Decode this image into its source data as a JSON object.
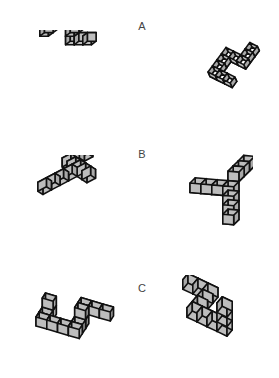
{
  "colors": {
    "top": "#ffffff",
    "left": "#bdbdbd",
    "right": "#a9a9a9",
    "edge": "#111111"
  },
  "pairs": [
    {
      "label": "A",
      "left_figure": {
        "name": "figure-a-left",
        "x": 20,
        "y": 30,
        "w": 105,
        "h": 62,
        "origin": [
          34,
          4
        ],
        "scale": 8.6,
        "proj": [
          [
            1,
            0.0
          ],
          [
            -0.55,
            0.42
          ],
          [
            0,
            -1
          ]
        ],
        "cubes": [
          [
            0,
            0,
            1
          ],
          [
            1,
            0,
            1
          ],
          [
            2,
            0,
            1
          ],
          [
            3,
            0,
            1
          ],
          [
            0,
            1,
            1
          ],
          [
            0,
            2,
            1
          ],
          [
            3,
            1,
            1
          ],
          [
            3,
            2,
            0
          ],
          [
            3,
            2,
            1
          ],
          [
            4,
            2,
            0
          ],
          [
            5,
            2,
            0
          ]
        ]
      },
      "right_figure": {
        "name": "figure-a-right",
        "x": 168,
        "y": 22,
        "w": 100,
        "h": 72,
        "origin": [
          40,
          50
        ],
        "scale": 8.2,
        "proj": [
          [
            0.9,
            0.45
          ],
          [
            0.55,
            -0.75
          ],
          [
            0.25,
            0.55
          ]
        ],
        "cubes": [
          [
            0,
            0,
            0
          ],
          [
            1,
            0,
            0
          ],
          [
            2,
            0,
            0
          ],
          [
            0,
            1,
            0
          ],
          [
            0,
            2,
            0
          ],
          [
            0,
            3,
            0
          ],
          [
            1,
            3,
            0
          ],
          [
            2,
            3,
            0
          ],
          [
            2,
            4,
            0
          ],
          [
            2,
            5,
            0
          ]
        ]
      }
    },
    {
      "label": "B",
      "left_figure": {
        "name": "figure-b-left",
        "x": 18,
        "y": 155,
        "w": 100,
        "h": 80,
        "origin": [
          10,
          30
        ],
        "scale": 9,
        "proj": [
          [
            0.95,
            -0.5
          ],
          [
            0.55,
            0.35
          ],
          [
            0,
            -1
          ]
        ],
        "cubes": [
          [
            0,
            2,
            0
          ],
          [
            1,
            2,
            0
          ],
          [
            2,
            2,
            0
          ],
          [
            3,
            2,
            0
          ],
          [
            4,
            0,
            0
          ],
          [
            4,
            1,
            0
          ],
          [
            4,
            2,
            0
          ],
          [
            4,
            3,
            0
          ],
          [
            4,
            4,
            0
          ],
          [
            5,
            0,
            0
          ],
          [
            6,
            0,
            0
          ]
        ]
      },
      "right_figure": {
        "name": "figure-b-right",
        "x": 178,
        "y": 143,
        "w": 75,
        "h": 100,
        "origin": [
          12,
          40
        ],
        "scale": 9.5,
        "proj": [
          [
            1.15,
            0.1
          ],
          [
            0.55,
            -0.55
          ],
          [
            0,
            1
          ]
        ],
        "cubes": [
          [
            0,
            0,
            0
          ],
          [
            1,
            0,
            0
          ],
          [
            2,
            0,
            0
          ],
          [
            3,
            0,
            0
          ],
          [
            3,
            0,
            1
          ],
          [
            3,
            0,
            2
          ],
          [
            3,
            0,
            3
          ],
          [
            3,
            1,
            -1
          ],
          [
            3,
            2,
            -1
          ],
          [
            3,
            3,
            -1
          ]
        ]
      }
    },
    {
      "label": "C",
      "left_figure": {
        "name": "figure-c-left",
        "x": 28,
        "y": 290,
        "w": 110,
        "h": 65,
        "origin": [
          8,
          36
        ],
        "scale": 9,
        "proj": [
          [
            1.2,
            0.35
          ],
          [
            0.35,
            -0.55
          ],
          [
            0,
            -1
          ]
        ],
        "cubes": [
          [
            0,
            0,
            0
          ],
          [
            1,
            0,
            0
          ],
          [
            2,
            0,
            0
          ],
          [
            3,
            0,
            0
          ],
          [
            0,
            1,
            0
          ],
          [
            0,
            2,
            0
          ],
          [
            0,
            2,
            1
          ],
          [
            3,
            1,
            0
          ],
          [
            3,
            2,
            0
          ],
          [
            3,
            2,
            1
          ],
          [
            3,
            3,
            1
          ],
          [
            4,
            3,
            1
          ],
          [
            5,
            3,
            1
          ]
        ]
      },
      "right_figure": {
        "name": "figure-c-right",
        "x": 180,
        "y": 275,
        "w": 85,
        "h": 80,
        "origin": [
          8,
          8
        ],
        "scale": 9.5,
        "proj": [
          [
            1.05,
            0.5
          ],
          [
            -0.55,
            0.65
          ],
          [
            0,
            -1
          ]
        ],
        "cubes": [
          [
            0,
            0,
            0
          ],
          [
            1,
            0,
            0
          ],
          [
            2,
            0,
            0
          ],
          [
            2,
            1,
            0
          ],
          [
            2,
            2,
            0
          ],
          [
            2,
            3,
            0
          ],
          [
            3,
            3,
            0
          ],
          [
            4,
            3,
            0
          ],
          [
            5,
            3,
            0
          ],
          [
            5,
            3,
            1
          ],
          [
            5,
            3,
            2
          ]
        ]
      }
    }
  ],
  "labels": {
    "a": "A",
    "b": "B",
    "c": "C"
  }
}
